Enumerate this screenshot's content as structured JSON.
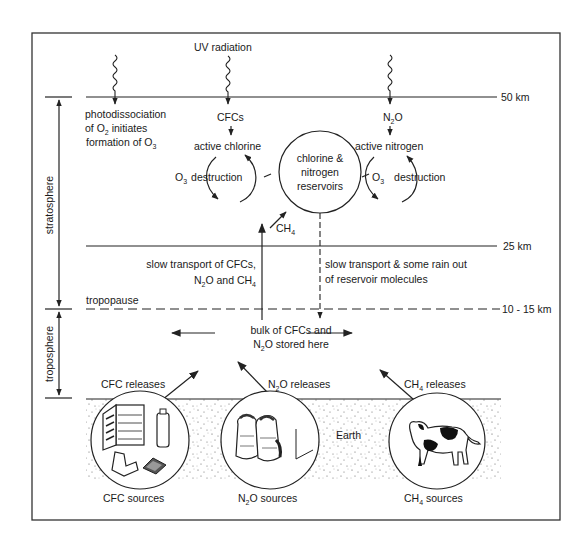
{
  "diagram": {
    "altitudes": {
      "top": "50 km",
      "middle": "25 km",
      "tropopause": "10 - 15 km"
    },
    "layers": {
      "stratosphere": "stratosphere",
      "troposphere": "troposphere",
      "tropopause": "tropopause"
    },
    "uv_label": "UV radiation",
    "photodissociation": {
      "line1": "photodissociation",
      "line2a": "of O",
      "line2sub": "2",
      "line2b": " initiates",
      "line3a": "formation of O",
      "line3sub": "3"
    },
    "chlorine_cycle": {
      "source": "CFCs",
      "active": "active chlorine",
      "o3": "O",
      "o3sub": "3",
      "destruction": "destruction"
    },
    "nitrogen_cycle": {
      "source_a": "N",
      "source_sub": "2",
      "source_b": "O",
      "active": "active nitrogen",
      "o3": "O",
      "o3sub": "3",
      "destruction": "destruction"
    },
    "reservoir": {
      "line1": "chlorine &",
      "line2": "nitrogen",
      "line3": "reservoirs"
    },
    "ch4_input": {
      "a": "CH",
      "sub": "4"
    },
    "slow_transport_up": {
      "line1": "slow transport of CFCs,",
      "line2a": "N",
      "line2sub": "2",
      "line2b": "O and CH",
      "line2sub2": "4"
    },
    "slow_transport_down": {
      "line1": "slow transport & some rain out",
      "line2": "of reservoir molecules"
    },
    "storage": {
      "line1": "bulk of CFCs and",
      "line2a": "N",
      "line2sub": "2",
      "line2b": "O stored here"
    },
    "releases": {
      "cfc": "CFC releases",
      "n2o_a": "N",
      "n2o_sub": "2",
      "n2o_b": "O releases",
      "ch4_a": "CH",
      "ch4_sub": "4",
      "ch4_b": " releases"
    },
    "earth_label": "Earth",
    "sources": {
      "cfc": "CFC sources",
      "n2o_a": "N",
      "n2o_sub": "2",
      "n2o_b": "O sources",
      "ch4_a": "CH",
      "ch4_sub": "4",
      "ch4_b": " sources"
    },
    "icons": [
      "refrigerator-icon",
      "aerosol-can-icon",
      "car-seat-icon",
      "foam-packaging-icon",
      "fertilizer-sacks-icon",
      "cow-icon"
    ]
  }
}
